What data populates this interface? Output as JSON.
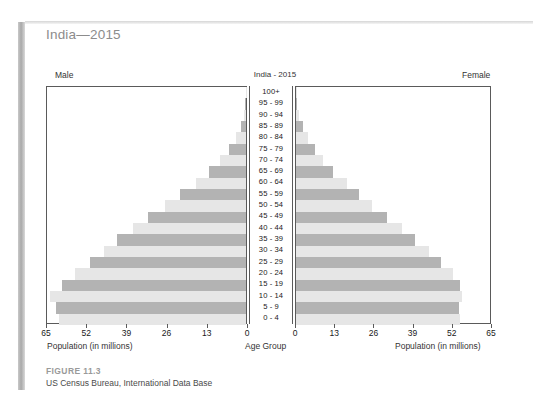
{
  "page": {
    "chapter_title": "India—2015"
  },
  "chart": {
    "title": "India - 2015",
    "left_label": "Male",
    "right_label": "Female",
    "left_axis_title": "Population (in millions)",
    "center_axis_title": "Age Group",
    "right_axis_title": "Population (in millions)",
    "left_ticks": [
      "65",
      "52",
      "39",
      "26",
      "13",
      "0"
    ],
    "right_ticks": [
      "0",
      "13",
      "26",
      "39",
      "52",
      "65"
    ]
  },
  "caption": {
    "figure": "FIGURE 11.3",
    "source": "US Census Bureau, International Data Base"
  },
  "colors": {
    "bar_dark": "#b3b3b3",
    "bar_light": "#e6e6e6",
    "frame": "#5a5a5a",
    "chapter_title": "#8c8c8c",
    "figure_label": "#9a9a9a"
  },
  "chart_data": {
    "type": "bar",
    "subtype": "population-pyramid",
    "title": "India - 2015",
    "xlabel": "Population (in millions)",
    "ylabel": "Age Group",
    "xlim": [
      0,
      65
    ],
    "xticks": [
      0,
      13,
      26,
      39,
      52,
      65
    ],
    "grid": false,
    "legend": [
      "Male",
      "Female"
    ],
    "legend_position": "top-outside",
    "categories": [
      "100+",
      "95 - 99",
      "90 - 94",
      "85 - 89",
      "80 - 84",
      "75 - 79",
      "70 - 74",
      "65 - 69",
      "60 - 64",
      "55 - 59",
      "50 - 54",
      "45 - 49",
      "40 - 44",
      "35 - 39",
      "30 - 34",
      "25 - 29",
      "20 - 24",
      "15 - 19",
      "10 - 14",
      "5 - 9",
      "0 - 4"
    ],
    "series": [
      {
        "name": "Male",
        "side": "left",
        "color": "#b3b3b3",
        "values": [
          0.1,
          0.3,
          0.8,
          1.8,
          3.4,
          5.6,
          8.4,
          12.0,
          16.5,
          21.5,
          26.5,
          32.0,
          37.0,
          42.0,
          46.5,
          51.0,
          56.0,
          60.0,
          64.0,
          62.0,
          61.0
        ]
      },
      {
        "name": "Female",
        "side": "right",
        "color": "#b3b3b3",
        "values": [
          0.1,
          0.4,
          1.0,
          2.2,
          4.0,
          6.2,
          9.0,
          12.5,
          17.0,
          21.0,
          25.5,
          30.5,
          35.5,
          40.0,
          44.5,
          48.5,
          52.5,
          55.0,
          55.5,
          54.5,
          55.0
        ]
      }
    ]
  }
}
